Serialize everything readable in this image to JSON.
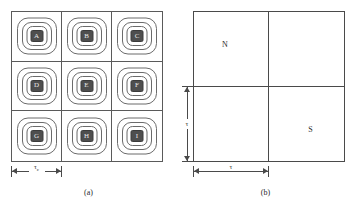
{
  "figure": {
    "panels": [
      {
        "id": "a",
        "caption": "(a)",
        "type": "3x3-cell-grid-with-contours",
        "rows": 3,
        "cols": 3,
        "cells": [
          {
            "label": "A"
          },
          {
            "label": "B"
          },
          {
            "label": "C"
          },
          {
            "label": "D"
          },
          {
            "label": "E"
          },
          {
            "label": "F"
          },
          {
            "label": "G"
          },
          {
            "label": "H"
          },
          {
            "label": "I"
          }
        ],
        "contour_rings_per_cell": 3,
        "dimension": {
          "name": "cell-width",
          "symbol": "τ",
          "subscript": "c",
          "orientation": "horizontal",
          "spans": "one cell column"
        }
      },
      {
        "id": "b",
        "caption": "(b)",
        "type": "2x2-quadrant-grid",
        "rows": 2,
        "cols": 2,
        "quadrants": [
          {
            "position": "top-left",
            "label": "N"
          },
          {
            "position": "top-right",
            "label": ""
          },
          {
            "position": "bottom-left",
            "label": ""
          },
          {
            "position": "bottom-right",
            "label": "S"
          }
        ],
        "dimensions": [
          {
            "name": "quadrant-height",
            "symbol": "τ",
            "orientation": "vertical",
            "spans": "bottom half"
          },
          {
            "name": "quadrant-width",
            "symbol": "τ",
            "orientation": "horizontal",
            "spans": "left half"
          }
        ]
      }
    ],
    "colors": {
      "stroke": "#4a4a4a",
      "contour_stroke": "#6b6b6b",
      "core_fill": "#4e4e4e",
      "core_text": "#e9e9e9",
      "background": "#ffffff"
    }
  }
}
